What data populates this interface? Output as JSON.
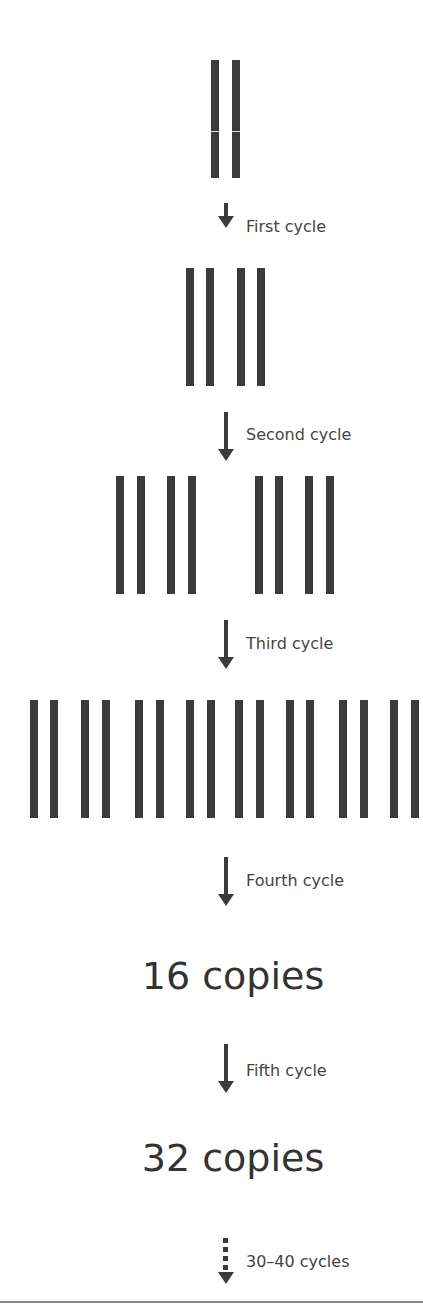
{
  "diagram": {
    "topic": "DNA copies doubling each amplification cycle",
    "colors": {
      "strand": "#3b3b3b",
      "text": "#444444",
      "background": "#ffffff",
      "rule": "#8a8a8a"
    },
    "stages": [
      {
        "copies": 1,
        "strands": 2
      },
      {
        "copies": 2,
        "strands": 4
      },
      {
        "copies": 4,
        "strands": 8
      },
      {
        "copies": 8,
        "strands": 16
      }
    ],
    "steps": [
      {
        "label": "First cycle",
        "arrow": "solid"
      },
      {
        "label": "Second cycle",
        "arrow": "solid"
      },
      {
        "label": "Third cycle",
        "arrow": "solid"
      },
      {
        "label": "Fourth cycle",
        "arrow": "solid"
      },
      {
        "label": "Fifth cycle",
        "arrow": "solid"
      },
      {
        "label": "30–40 cycles",
        "arrow": "dotted"
      }
    ],
    "results": [
      {
        "text": "16 copies"
      },
      {
        "text": "32 copies"
      }
    ]
  }
}
